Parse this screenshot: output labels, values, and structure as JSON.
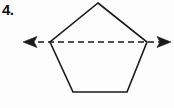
{
  "figure": {
    "problem_number": "4.",
    "background_color": "#fdfdfd",
    "stroke_color": "#1a1a1a",
    "stroke_width": 1.6,
    "canvas": {
      "width": 174,
      "height": 108
    },
    "shape": {
      "name": "pentagon",
      "type": "regular-pentagon",
      "sides": 5,
      "fill": "none",
      "vertices": [
        {
          "label": "apex",
          "x": 98,
          "y": 3
        },
        {
          "label": "upper-right",
          "x": 147,
          "y": 42
        },
        {
          "label": "lower-right",
          "x": 127,
          "y": 92
        },
        {
          "label": "lower-left",
          "x": 73,
          "y": 92
        },
        {
          "label": "upper-left",
          "x": 50,
          "y": 42
        }
      ]
    },
    "line": {
      "name": "horizontal-dashed-line",
      "style": "dashed",
      "dash_pattern": "6,4",
      "y": 42,
      "x_start": 28,
      "x_end": 166,
      "arrowheads": "both",
      "passes_through": [
        "upper-left",
        "upper-right"
      ]
    },
    "arrow_left": {
      "name": "left-arrowhead",
      "tip_x": 23,
      "tip_y": 42,
      "direction": "left"
    },
    "arrow_right": {
      "name": "right-arrowhead",
      "tip_x": 171,
      "tip_y": 42,
      "direction": "right"
    },
    "watermark": ""
  }
}
